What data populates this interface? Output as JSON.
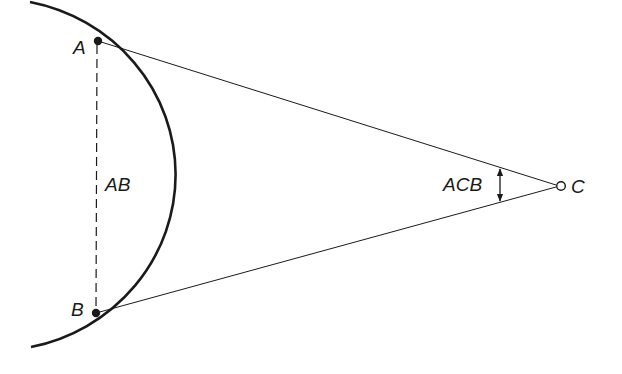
{
  "diagram": {
    "colors": {
      "background": "#ffffff",
      "stroke": "#1a1a1a"
    },
    "points": {
      "A": {
        "label": "A",
        "x": 98,
        "y": 41
      },
      "B": {
        "label": "B",
        "x": 96,
        "y": 313
      },
      "C": {
        "label": "C",
        "x": 561,
        "y": 186
      }
    },
    "labels": {
      "chord": "AB",
      "angle": "ACB",
      "point_a": "A",
      "point_b": "B",
      "point_c": "C"
    },
    "arc": {
      "cx": -21,
      "cy": 176,
      "r": 181,
      "start": [
        30,
        2
      ],
      "end": [
        31,
        347
      ]
    },
    "chord": {
      "style": "dashed",
      "from": "A",
      "to": "B"
    },
    "rays": [
      {
        "from": "A",
        "to": "C"
      },
      {
        "from": "B",
        "to": "C"
      }
    ],
    "angle_marker": {
      "type": "double-arrow",
      "x": 500,
      "y1": 167,
      "y2": 203
    }
  }
}
